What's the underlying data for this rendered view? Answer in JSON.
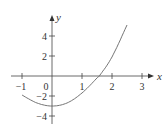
{
  "chart_data": {
    "type": "line",
    "title": "",
    "xlabel": "x",
    "ylabel": "y",
    "xlim": [
      -1.1,
      3.2
    ],
    "ylim": [
      -5,
      5.6
    ],
    "grid": false,
    "x_ticks": [
      -1,
      0,
      1,
      2,
      3
    ],
    "x_tick_labels": [
      "−1",
      "0",
      "1",
      "2",
      "3"
    ],
    "y_ticks": [
      -4,
      -2,
      2,
      4
    ],
    "y_tick_labels": [
      "−4",
      "−2",
      "2",
      "4"
    ],
    "series": [
      {
        "name": "curve",
        "x": [
          -1,
          -0.5,
          0,
          0.5,
          1,
          1.5,
          1.6,
          2,
          2.5
        ],
        "y": [
          -1.9,
          -2.7,
          -3.0,
          -2.7,
          -1.7,
          -0.2,
          0.1,
          1.9,
          5.1
        ]
      }
    ],
    "annotations": []
  },
  "axes": {
    "x_label": "x",
    "y_label": "y",
    "x_tick_labels": [
      "−1",
      "0",
      "1",
      "2",
      "3"
    ],
    "y_tick_labels": [
      "4",
      "2",
      "−2",
      "−4"
    ]
  },
  "colors": {
    "axis": "#444444",
    "curve": "#666666",
    "text": "#333333"
  }
}
